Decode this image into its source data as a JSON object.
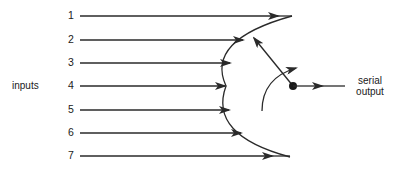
{
  "diagram": {
    "inputs_label": "inputs",
    "input_lines": [
      {
        "label": "1",
        "y": 16,
        "end_x": 292,
        "arrow_x": 278
      },
      {
        "label": "2",
        "y": 40,
        "end_x": 245,
        "arrow_x": 243
      },
      {
        "label": "3",
        "y": 63,
        "end_x": 232,
        "arrow_x": 230
      },
      {
        "label": "4",
        "y": 86,
        "end_x": 226,
        "arrow_x": 225
      },
      {
        "label": "5",
        "y": 110,
        "end_x": 230,
        "arrow_x": 229
      },
      {
        "label": "6",
        "y": 133,
        "end_x": 242,
        "arrow_x": 241
      },
      {
        "label": "7",
        "y": 156,
        "end_x": 290,
        "arrow_x": 272
      }
    ],
    "output_label_line1": "serial",
    "output_label_line2": "output",
    "colors": {
      "stroke": "#2a2a2a",
      "text": "#1a1a1a",
      "background": "#ffffff"
    }
  }
}
